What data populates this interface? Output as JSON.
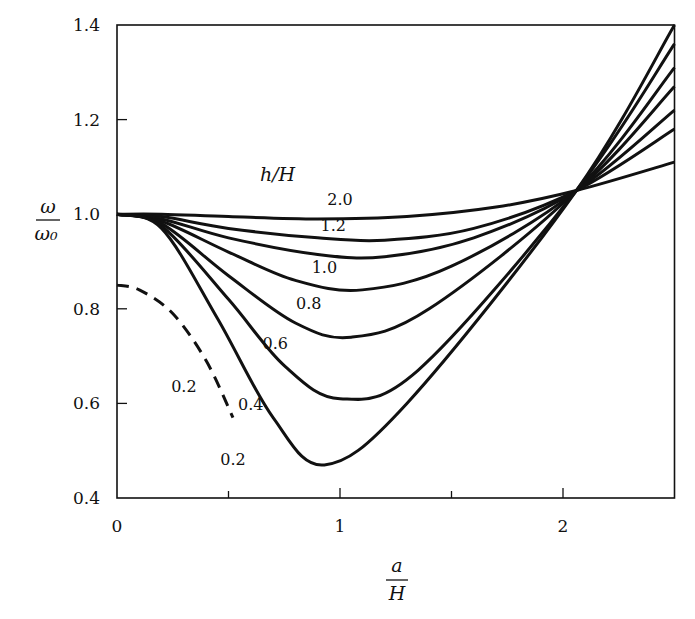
{
  "chart_data": {
    "type": "line",
    "title": "",
    "xlabel": "a/H",
    "ylabel": "ω/ω₀",
    "xlim": [
      0,
      2.5
    ],
    "ylim": [
      0.4,
      1.4
    ],
    "grid": false,
    "legend_title": "h/H",
    "x_ticks": [
      {
        "value": 0,
        "label": "0"
      },
      {
        "value": 0.5,
        "label": ""
      },
      {
        "value": 1,
        "label": "1"
      },
      {
        "value": 1.5,
        "label": ""
      },
      {
        "value": 2,
        "label": "2"
      }
    ],
    "y_ticks": [
      {
        "value": 0.4,
        "label": "0.4"
      },
      {
        "value": 0.6,
        "label": "0.6"
      },
      {
        "value": 0.8,
        "label": "0.8"
      },
      {
        "value": 1.0,
        "label": "1.0"
      },
      {
        "value": 1.2,
        "label": "1.2"
      },
      {
        "value": 1.4,
        "label": "1.4"
      }
    ],
    "series": [
      {
        "name": "2.0",
        "style": "solid",
        "x": [
          0,
          0.2,
          0.5,
          0.9,
          1.3,
          1.7,
          2.06,
          2.5
        ],
        "y": [
          1.0,
          1.0,
          0.995,
          0.99,
          0.995,
          1.015,
          1.05,
          1.11
        ]
      },
      {
        "name": "1.2",
        "style": "solid",
        "x": [
          0,
          0.2,
          0.5,
          0.9,
          1.2,
          1.6,
          2.06,
          2.5
        ],
        "y": [
          1.0,
          0.995,
          0.97,
          0.95,
          0.945,
          0.97,
          1.05,
          1.18
        ]
      },
      {
        "name": "1.0",
        "style": "solid",
        "x": [
          0,
          0.2,
          0.5,
          0.9,
          1.2,
          1.6,
          2.06,
          2.5
        ],
        "y": [
          1.0,
          0.99,
          0.95,
          0.915,
          0.91,
          0.95,
          1.05,
          1.22
        ]
      },
      {
        "name": "0.8",
        "style": "solid",
        "x": [
          0,
          0.2,
          0.5,
          0.8,
          1.1,
          1.5,
          2.06,
          2.5
        ],
        "y": [
          1.0,
          0.985,
          0.92,
          0.86,
          0.84,
          0.89,
          1.05,
          1.27
        ]
      },
      {
        "name": "0.6",
        "style": "solid",
        "x": [
          0,
          0.2,
          0.5,
          0.8,
          1.05,
          1.4,
          2.06,
          2.5
        ],
        "y": [
          1.0,
          0.98,
          0.87,
          0.77,
          0.74,
          0.8,
          1.05,
          1.31
        ]
      },
      {
        "name": "0.4",
        "style": "solid",
        "x": [
          0,
          0.2,
          0.5,
          0.75,
          1.0,
          1.35,
          2.06,
          2.5
        ],
        "y": [
          1.0,
          0.975,
          0.82,
          0.68,
          0.61,
          0.67,
          1.05,
          1.36
        ]
      },
      {
        "name": "0.2",
        "style": "solid",
        "x": [
          0,
          0.2,
          0.45,
          0.7,
          0.93,
          1.3,
          2.06,
          2.5
        ],
        "y": [
          1.0,
          0.97,
          0.78,
          0.57,
          0.47,
          0.6,
          1.05,
          1.4
        ]
      },
      {
        "name": "0.2 (dashed)",
        "style": "dashed",
        "x": [
          0,
          0.1,
          0.25,
          0.4,
          0.52
        ],
        "y": [
          0.85,
          0.84,
          0.79,
          0.69,
          0.57
        ]
      }
    ],
    "annotations": [
      {
        "text": "h/H",
        "x": 0.72,
        "y": 1.07
      },
      {
        "text": "2.0",
        "x": 1.0,
        "y": 1.02
      },
      {
        "text": "1.2",
        "x": 0.97,
        "y": 0.965
      },
      {
        "text": "1.0",
        "x": 0.93,
        "y": 0.875
      },
      {
        "text": "0.8",
        "x": 0.86,
        "y": 0.8
      },
      {
        "text": "0.6",
        "x": 0.71,
        "y": 0.715
      },
      {
        "text": "0.4",
        "x": 0.6,
        "y": 0.585
      },
      {
        "text": "0.2",
        "x": 0.52,
        "y": 0.47
      },
      {
        "text": "0.2",
        "x": 0.3,
        "y": 0.625
      }
    ]
  },
  "axes": {
    "y_label_top": "ω",
    "y_label_bottom": "ω₀",
    "x_label_top": "a",
    "x_label_bottom": "H"
  }
}
